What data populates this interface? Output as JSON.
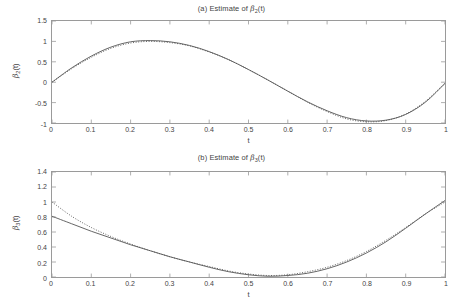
{
  "figure": {
    "background_color": "#ffffff",
    "line_color": "#555555",
    "axis_color": "#9a9a9a",
    "text_color": "#444444"
  },
  "panels": [
    {
      "id": "a",
      "title": "(a) Estimate of β₂(t)",
      "title_prefix": "(a) Estimate of ",
      "title_symbol": "β",
      "title_subscript": "2",
      "title_suffix": "(t)",
      "xlabel": "t",
      "ylabel_symbol": "β",
      "ylabel_subscript": "2",
      "ylabel_suffix": "(t)",
      "yticks": [
        "1.5",
        "1",
        "0.5",
        "0",
        "-0.5",
        "-1"
      ],
      "xticks": [
        "0",
        "0.1",
        "0.2",
        "0.3",
        "0.4",
        "0.5",
        "0.6",
        "0.7",
        "0.8",
        "0.9",
        "1"
      ]
    },
    {
      "id": "b",
      "title": "(b) Estimate of β₃(t)",
      "title_prefix": "(b) Estimate of ",
      "title_symbol": "β",
      "title_subscript": "3",
      "title_suffix": "(t)",
      "xlabel": "t",
      "ylabel_symbol": "β",
      "ylabel_subscript": "3",
      "ylabel_suffix": "(t)",
      "yticks": [
        "1.4",
        "1.2",
        "1",
        "0.8",
        "0.6",
        "0.4",
        "0.2",
        "0"
      ],
      "xticks": [
        "0",
        "0.1",
        "0.2",
        "0.3",
        "0.4",
        "0.5",
        "0.6",
        "0.7",
        "0.8",
        "0.9",
        "1"
      ]
    }
  ],
  "chart_data": [
    {
      "type": "line",
      "panel": "a",
      "title": "(a) Estimate of β₂(t)",
      "xlabel": "t",
      "ylabel": "β₂(t)",
      "xlim": [
        0,
        1
      ],
      "ylim": [
        -1,
        1.5
      ],
      "xticks": [
        0,
        0.1,
        0.2,
        0.3,
        0.4,
        0.5,
        0.6,
        0.7,
        0.8,
        0.9,
        1
      ],
      "yticks": [
        -1,
        -0.5,
        0,
        0.5,
        1,
        1.5
      ],
      "grid": false,
      "legend": "none",
      "x": [
        0,
        0.05,
        0.1,
        0.15,
        0.2,
        0.25,
        0.3,
        0.35,
        0.4,
        0.45,
        0.5,
        0.55,
        0.6,
        0.65,
        0.7,
        0.75,
        0.8,
        0.85,
        0.9,
        0.95,
        1
      ],
      "series": [
        {
          "name": "estimate",
          "style": "solid",
          "values": [
            0.0,
            0.35,
            0.64,
            0.86,
            0.99,
            1.02,
            0.99,
            0.9,
            0.75,
            0.55,
            0.31,
            0.05,
            -0.22,
            -0.48,
            -0.7,
            -0.87,
            -0.95,
            -0.93,
            -0.79,
            -0.49,
            -0.03
          ]
        },
        {
          "name": "true",
          "style": "dotted",
          "values": [
            0.0,
            0.33,
            0.61,
            0.83,
            0.96,
            1.0,
            0.97,
            0.89,
            0.74,
            0.55,
            0.31,
            0.05,
            -0.22,
            -0.49,
            -0.72,
            -0.9,
            -0.97,
            -0.94,
            -0.78,
            -0.47,
            -0.02
          ]
        }
      ]
    },
    {
      "type": "line",
      "panel": "b",
      "title": "(b) Estimate of β₃(t)",
      "xlabel": "t",
      "ylabel": "β₃(t)",
      "xlim": [
        0,
        1
      ],
      "ylim": [
        0,
        1.4
      ],
      "xticks": [
        0,
        0.1,
        0.2,
        0.3,
        0.4,
        0.5,
        0.6,
        0.7,
        0.8,
        0.9,
        1
      ],
      "yticks": [
        0,
        0.2,
        0.4,
        0.6,
        0.8,
        1.0,
        1.2,
        1.4
      ],
      "grid": false,
      "legend": "none",
      "x": [
        0,
        0.05,
        0.1,
        0.15,
        0.2,
        0.25,
        0.3,
        0.35,
        0.4,
        0.45,
        0.5,
        0.55,
        0.6,
        0.65,
        0.7,
        0.75,
        0.8,
        0.85,
        0.9,
        0.95,
        1
      ],
      "series": [
        {
          "name": "estimate",
          "style": "solid",
          "values": [
            0.81,
            0.71,
            0.61,
            0.52,
            0.43,
            0.35,
            0.27,
            0.2,
            0.13,
            0.07,
            0.03,
            0.01,
            0.02,
            0.05,
            0.11,
            0.2,
            0.32,
            0.47,
            0.65,
            0.84,
            1.02
          ]
        },
        {
          "name": "true",
          "style": "dotted",
          "values": [
            1.0,
            0.81,
            0.66,
            0.54,
            0.44,
            0.35,
            0.27,
            0.2,
            0.14,
            0.08,
            0.04,
            0.02,
            0.03,
            0.07,
            0.13,
            0.22,
            0.34,
            0.49,
            0.66,
            0.84,
            1.0
          ]
        }
      ]
    }
  ]
}
